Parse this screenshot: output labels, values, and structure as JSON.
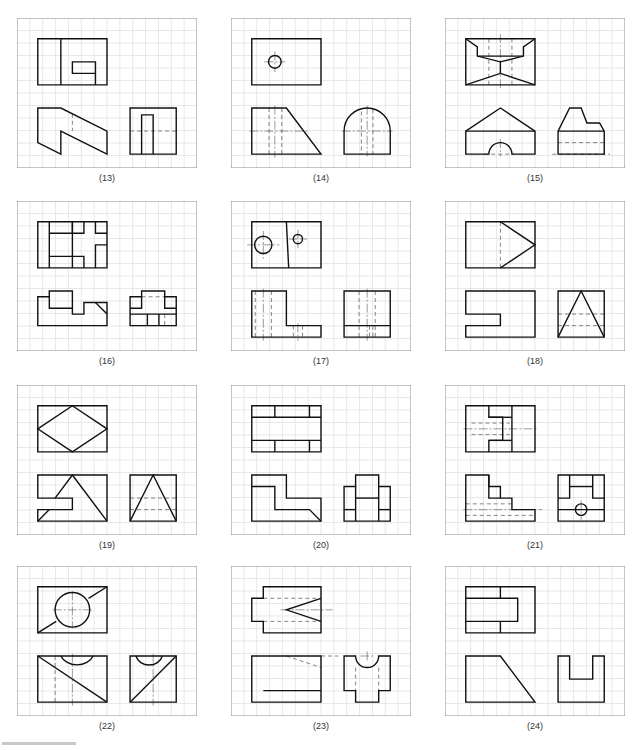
{
  "sheet": {
    "title": "Three-view orthographic projection exercises",
    "grid": {
      "cols": 14,
      "rows": 12,
      "line_color": "#d9d9d9"
    },
    "colors": {
      "visible_line": "#111111",
      "hidden_line": "#777777",
      "center_line": "#555555",
      "frame": "#8a8a8a"
    }
  },
  "panels": [
    {
      "id": 13,
      "label": "(13)",
      "views": {
        "top": {
          "visible": [
            "M3,3H9V7H8V5H6V6H8V7H3Z",
            "M5,3V7"
          ]
        },
        "front": {
          "visible": [
            "M3,9V12L5,13V11L9,13V11L5,9Z"
          ],
          "hidden": [
            "M6,9.5V11"
          ]
        },
        "side": {
          "visible": [
            "M11,9H15V13H11Z",
            "M12,13V9.6H13V13"
          ],
          "hidden": [
            "M11,11H15"
          ]
        }
      }
    },
    {
      "id": 14,
      "label": "(14)",
      "views": {
        "top": {
          "visible": [
            "M3,3H9V7H3Z"
          ],
          "circles": [
            [
              5,
              5,
              0.55
            ]
          ],
          "center": [
            "M4.1,5H5.9",
            "M5,4.1V5.9"
          ]
        },
        "front": {
          "visible": [
            "M3,9H6L9,13H3Z"
          ],
          "hidden": [
            "M4.5,9V13",
            "M5.6,9V13"
          ],
          "center": [
            "M2.8,11H8",
            "M5,8.8V13.3"
          ]
        },
        "side": {
          "visible": [
            "M11,13V11A2,2 0 0 1 15,11V13Z"
          ],
          "hidden": [
            "M12.5,9.3V13",
            "M13.5,9.1V13"
          ],
          "center": [
            "M10.8,11H15.2",
            "M13,8.8V13.2"
          ]
        }
      }
    },
    {
      "id": 15,
      "label": "(15)",
      "views": {
        "top": {
          "visible": [
            "M3,3H9V7H3Z",
            "M3,3L4,3.7V4.5L6,5L8,4.5V3.7L9,3",
            "M4,4.5H8",
            "M3,7L6,6L9,7",
            "M6,5V6"
          ],
          "hidden": [
            "M5,3V7",
            "M7,3V7"
          ],
          "center": [
            "M6,2.6V7.4"
          ]
        },
        "front": {
          "visible": [
            "M3,11L6,9L9,11V13H7A1,1 0 0 0 5,13H3Z",
            "M3,11H9"
          ],
          "hidden": [
            "M4.6,13H7.2"
          ],
          "center": [
            "M6,11.7V13.2"
          ]
        },
        "side": {
          "visible": [
            "M11,11L12,9H13L13.5,10.3H14.6L15,11V13H11Z",
            "M11,11H15"
          ],
          "hidden": [
            "M11,12H15",
            "M10.5,13H15.5"
          ]
        }
      }
    },
    {
      "id": 16,
      "label": "(16)",
      "views": {
        "top": {
          "visible": [
            "M3,3H9V7H3Z",
            "M4,3V7",
            "M4,4H6V3",
            "M6,3V7",
            "M4,6H7V7",
            "M6,4H7V3",
            "M8,3V4H9",
            "M8,7V5H9"
          ]
        },
        "front": {
          "visible": [
            "M3,9.5H4V9H6V11H7V10H9V12H3Z",
            "M4,9.5V10.5H6",
            "M8,10L9,11"
          ]
        },
        "side": {
          "visible": [
            "M11,9.5H12V9H14V9.5H15V12H11Z",
            "M12,9.5V10.5H11",
            "M14,9.5V10.5H15",
            "M11,11H15",
            "M12.5,11V12",
            "M13.5,11V12"
          ],
          "hidden": [
            "M12,9.5H14",
            "M11,12H12",
            "M14,12H15",
            "M14,11V12"
          ]
        }
      }
    },
    {
      "id": 17,
      "label": "(17)",
      "views": {
        "top": {
          "visible": [
            "M3,3H9V7H3Z",
            "M6,3L6.2,7"
          ],
          "circles": [
            [
              4,
              5,
              0.75
            ],
            [
              7,
              4.5,
              0.4
            ]
          ],
          "center": [
            "M2.6,5H5.4",
            "M4,3.8V6.2",
            "M6.2,4.5H7.8",
            "M7,3.7V5.3"
          ]
        },
        "front": {
          "visible": [
            "M3,9H6V12H9V13H3Z"
          ],
          "hidden": [
            "M3.3,9V13",
            "M4.7,9V13",
            "M6.6,12V13",
            "M7.4,12V13"
          ],
          "center": [
            "M4,8.8V13.3",
            "M7,11.8V13.3"
          ]
        },
        "side": {
          "visible": [
            "M11,9H15V13H11Z",
            "M11,12H15"
          ],
          "hidden": [
            "M12.3,9V13",
            "M13.7,9V13",
            "M13.2,12V13",
            "M13.5,12V13"
          ],
          "center": [
            "M13,8.8V13.3"
          ]
        }
      }
    },
    {
      "id": 18,
      "label": "(18)",
      "views": {
        "top": {
          "visible": [
            "M3,3H9V7H3Z",
            "M6,3L9,5L6,7"
          ],
          "hidden": [
            "M6,3V7"
          ]
        },
        "front": {
          "visible": [
            "M3,9H9V13H3V12H6V11H3Z"
          ]
        },
        "side": {
          "visible": [
            "M11,9H15V13H11Z",
            "M11,13L13,9L15,13"
          ],
          "hidden": [
            "M11,11H15",
            "M11,12H15"
          ]
        }
      }
    },
    {
      "id": 19,
      "label": "(19)",
      "views": {
        "top": {
          "visible": [
            "M3,3H9V7H3Z",
            "M3,5L6,3L9,5L6,7Z"
          ]
        },
        "front": {
          "visible": [
            "M3,9H9V13H3V12H6V11H3Z",
            "M9,13L6,9L4.5,11",
            "M3,13L4,12"
          ]
        },
        "side": {
          "visible": [
            "M11,9H15V13H11Z",
            "M11,13L13,9L15,13"
          ],
          "hidden": [
            "M11,11H15",
            "M11,12H15"
          ]
        }
      }
    },
    {
      "id": 20,
      "label": "(20)",
      "views": {
        "top": {
          "visible": [
            "M3,3H9V7H3Z",
            "M3,4H9",
            "M3,6H9",
            "M5,3V4",
            "M8,3V4",
            "M5,6V7",
            "M8,6V7"
          ]
        },
        "front": {
          "visible": [
            "M3,9H6V11H9V13H3Z",
            "M3,10H5V12H8L9,13"
          ]
        },
        "side": {
          "visible": [
            "M12,9H14V10H15V13H11V10H12Z",
            "M12,10V13",
            "M14,10V13",
            "M12,11H14",
            "M11,12H12",
            "M14,12H15"
          ]
        }
      }
    },
    {
      "id": 21,
      "label": "(21)",
      "views": {
        "top": {
          "visible": [
            "M3,3H9V7H3Z",
            "M5,3V4H6.2V6H5V7",
            "M7,3V7",
            "M5,6H7",
            "M5,4H7"
          ],
          "hidden": [
            "M3.5,4.5H6.8",
            "M3.5,5.5H6.8"
          ],
          "center": [
            "M2.8,5H9.3"
          ]
        },
        "front": {
          "visible": [
            "M3,9H5V10H6V11H7V12H9V13H3Z",
            "M5,9V11H6"
          ],
          "hidden": [
            "M3,11.5H7",
            "M3,12.5H9"
          ],
          "center": [
            "M2.8,12H9.6"
          ]
        },
        "side": {
          "visible": [
            "M11,9H15V13H11Z",
            "M12,9V11H11",
            "M14,9V11H15",
            "M12,10H14",
            "M11,12H15"
          ],
          "circles": [
            [
              13,
              12,
              0.5
            ]
          ],
          "center": [
            "M13,11.2V12.9"
          ]
        }
      }
    },
    {
      "id": 22,
      "label": "(22)",
      "views": {
        "top": {
          "visible": [
            "M3,3H9V7H3Z",
            "M3,7L4.6,6",
            "M7.4,4L9,3"
          ],
          "circles": [
            [
              6,
              5,
              1.5
            ]
          ],
          "center": [
            "M4.3,5H7.7",
            "M6,3.4V6.6"
          ]
        },
        "front": {
          "visible": [
            "M3,9H9V13H3Z",
            "M3,9L9,13",
            "M5,9A1.5,1.2 0 0 0 7.8,9"
          ],
          "hidden": [
            "M4.5,9V13"
          ],
          "center": [
            "M6,8.8V13.3"
          ]
        },
        "side": {
          "visible": [
            "M11,9H15V13H11Z",
            "M11,13L15,9",
            "M11.5,9A1.2,1.1 0 0 0 13.8,9"
          ],
          "center": [
            "M13,8.8V13.3"
          ]
        }
      }
    },
    {
      "id": 23,
      "label": "(23)",
      "views": {
        "top": {
          "visible": [
            "M4,3H9V7H4V6H3V4H4Z",
            "M9,4L6,5L9,6"
          ],
          "hidden": [
            "M4,4H9",
            "M4,6H9"
          ],
          "center": [
            "M5.5,5H10"
          ]
        },
        "front": {
          "visible": [
            "M3,9H9V13H3Z",
            "M4,12H9"
          ],
          "hidden": [
            "M6,9L9,10",
            "M9,9H10.5"
          ]
        },
        "side": {
          "visible": [
            "M11,9H12A1,1 0 0 0 14,9H15V12H14V13H12V12H11Z"
          ],
          "hidden": [
            "M12,10V12",
            "M14,10V12"
          ],
          "center": [
            "M13,8.6V9.4",
            "M12.4,9H13.6"
          ]
        }
      }
    },
    {
      "id": 24,
      "label": "(24)",
      "views": {
        "top": {
          "visible": [
            "M3,3H9V7H3Z",
            "M3,4H7.5V6H3",
            "M6,3V4",
            "M6,6V7"
          ]
        },
        "front": {
          "visible": [
            "M3,9H6L9,13H3Z"
          ]
        },
        "side": {
          "visible": [
            "M11,9H12V11H14V9H15V13H11Z"
          ]
        }
      }
    }
  ]
}
